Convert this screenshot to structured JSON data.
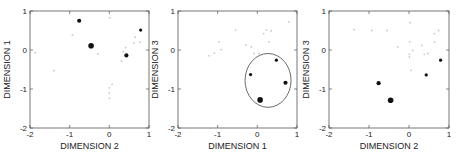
{
  "chart_data": [
    {
      "type": "scatter",
      "title": "",
      "xlabel": "DIMENSION 2",
      "ylabel": "DIMENSION 1",
      "xlim": [
        -2,
        1
      ],
      "ylim": [
        -2,
        1
      ],
      "xticks": [
        -2,
        -1,
        0,
        1
      ],
      "yticks": [
        -2,
        -1,
        0,
        1
      ],
      "grid": false,
      "frame": {
        "left": 30,
        "top": 11,
        "right": 149,
        "bottom": 128
      },
      "highlighted": [
        {
          "x": -0.76,
          "y": 0.75,
          "size": "medium"
        },
        {
          "x": -0.46,
          "y": 0.11,
          "size": "large"
        },
        {
          "x": 0.43,
          "y": -0.14,
          "size": "medium"
        },
        {
          "x": 0.79,
          "y": 0.51,
          "size": "small"
        }
      ],
      "background_points": [
        {
          "x": 0.01,
          "y": 0.83
        },
        {
          "x": -0.93,
          "y": 0.38
        },
        {
          "x": -0.29,
          "y": -0.1
        },
        {
          "x": -1.87,
          "y": -0.07
        },
        {
          "x": -1.4,
          "y": -0.53
        },
        {
          "x": 0.65,
          "y": 0.33
        },
        {
          "x": 0.62,
          "y": 0.18
        },
        {
          "x": 0.77,
          "y": 0.2
        },
        {
          "x": 0.41,
          "y": 0.06
        },
        {
          "x": 0.35,
          "y": -0.04
        },
        {
          "x": 0.31,
          "y": -0.28
        },
        {
          "x": 0.07,
          "y": -0.88
        },
        {
          "x": 0.0,
          "y": -0.97
        },
        {
          "x": 0.0,
          "y": -1.1
        },
        {
          "x": 0.0,
          "y": -1.24
        }
      ],
      "ellipse": null
    },
    {
      "type": "scatter",
      "title": "",
      "xlabel": "DIMENSION 1",
      "ylabel": "DIMENSION 3",
      "xlim": [
        -2,
        1
      ],
      "ylim": [
        -2,
        1
      ],
      "xticks": [
        -2,
        -1,
        0,
        1
      ],
      "yticks": [
        -2,
        -1,
        0,
        1
      ],
      "grid": false,
      "frame": {
        "left": 178,
        "top": 11,
        "right": 297,
        "bottom": 128
      },
      "highlighted": [
        {
          "x": 0.48,
          "y": -0.26,
          "size": "small"
        },
        {
          "x": -0.17,
          "y": -0.63,
          "size": "small"
        },
        {
          "x": 0.71,
          "y": -0.84,
          "size": "medium"
        },
        {
          "x": 0.07,
          "y": -1.28,
          "size": "large"
        }
      ],
      "background_points": [
        {
          "x": 0.79,
          "y": 0.72
        },
        {
          "x": -0.55,
          "y": 0.51
        },
        {
          "x": 0.23,
          "y": 0.51
        },
        {
          "x": 0.35,
          "y": 0.49
        },
        {
          "x": 0.16,
          "y": 0.42
        },
        {
          "x": -0.96,
          "y": 0.21
        },
        {
          "x": 0.29,
          "y": 0.21
        },
        {
          "x": -0.29,
          "y": 0.13
        },
        {
          "x": -0.15,
          "y": 0.08
        },
        {
          "x": -0.91,
          "y": 0.01
        },
        {
          "x": -1.08,
          "y": -0.08
        },
        {
          "x": -1.22,
          "y": -0.15
        },
        {
          "x": -0.08,
          "y": -0.09
        },
        {
          "x": 0.04,
          "y": -0.09
        }
      ],
      "ellipse": {
        "cx": 0.27,
        "cy": -0.78,
        "rx": 0.58,
        "ry": 0.69
      }
    },
    {
      "type": "scatter",
      "title": "",
      "xlabel": "DIMENSION 2",
      "ylabel": "DIMENSION 3",
      "xlim": [
        -2,
        1
      ],
      "ylim": [
        -2,
        1
      ],
      "xticks": [
        -2,
        -1,
        0,
        1
      ],
      "yticks": [
        -2,
        -1,
        0,
        1
      ],
      "grid": false,
      "frame": {
        "left": 329,
        "top": 11,
        "right": 449,
        "bottom": 128
      },
      "highlighted": [
        {
          "x": -0.76,
          "y": -0.85,
          "size": "medium"
        },
        {
          "x": -0.46,
          "y": -1.29,
          "size": "large"
        },
        {
          "x": 0.43,
          "y": -0.64,
          "size": "small"
        },
        {
          "x": 0.79,
          "y": -0.26,
          "size": "small"
        }
      ],
      "background_points": [
        {
          "x": -1.37,
          "y": 0.52
        },
        {
          "x": -0.93,
          "y": 0.5
        },
        {
          "x": -0.55,
          "y": 0.5
        },
        {
          "x": 0.03,
          "y": 0.7
        },
        {
          "x": 0.64,
          "y": 0.42
        },
        {
          "x": 0.74,
          "y": 0.5
        },
        {
          "x": 0.64,
          "y": 0.2
        },
        {
          "x": 0.02,
          "y": 0.21
        },
        {
          "x": -0.28,
          "y": 0.08
        },
        {
          "x": 0.32,
          "y": 0.12
        },
        {
          "x": 0.09,
          "y": -0.01
        },
        {
          "x": 0.01,
          "y": -0.11
        },
        {
          "x": 0.01,
          "y": -0.18
        },
        {
          "x": 0.38,
          "y": -0.11
        },
        {
          "x": 0.47,
          "y": -0.09
        },
        {
          "x": 0.05,
          "y": -0.52
        }
      ],
      "ellipse": null
    }
  ],
  "style": {
    "axis_color": "#555555",
    "highlight_color": "#111111",
    "background_point_color": "#c8c8c8",
    "ellipse_color": "#444444"
  }
}
